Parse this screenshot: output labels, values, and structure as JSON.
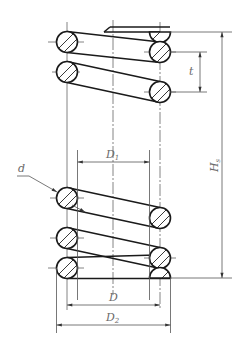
{
  "diagram": {
    "colors": {
      "outline": "#1a1a1a",
      "dimension": "#555555",
      "centerline": "#666666",
      "hatch": "#222222",
      "label": "#6a6a6a",
      "background": "#ffffff"
    },
    "labels": {
      "d": {
        "main": "d",
        "sub": ""
      },
      "D1": {
        "main": "D",
        "sub": "1"
      },
      "D": {
        "main": "D",
        "sub": ""
      },
      "D2": {
        "main": "D",
        "sub": "2"
      },
      "Hs": {
        "main": "H",
        "sub": "s"
      },
      "t": {
        "main": "t",
        "sub": ""
      }
    },
    "dimensions": [
      {
        "name": "wire-diameter",
        "label": "d"
      },
      {
        "name": "inner-diameter",
        "label": "D1"
      },
      {
        "name": "mean-diameter",
        "label": "D"
      },
      {
        "name": "outer-diameter",
        "label": "D2"
      },
      {
        "name": "solid-height",
        "label": "Hs"
      },
      {
        "name": "pitch",
        "label": "t"
      }
    ]
  }
}
